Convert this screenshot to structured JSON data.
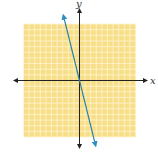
{
  "chart_data": {
    "type": "line",
    "title": "",
    "xlabel": "x",
    "ylabel": "y",
    "xlim": [
      -10,
      10
    ],
    "ylim": [
      -10,
      10
    ],
    "grid": true,
    "grid_color": "#f7df8a",
    "grid_line_color": "#fff6d8",
    "axis_color": "#222222",
    "series": [
      {
        "name": "y = -4x",
        "color": "#2a7fa8",
        "x": [
          -2.9,
          0,
          2.9
        ],
        "y": [
          11.6,
          0,
          -11.6
        ],
        "arrows": "both"
      }
    ],
    "tick_labels": "none"
  }
}
